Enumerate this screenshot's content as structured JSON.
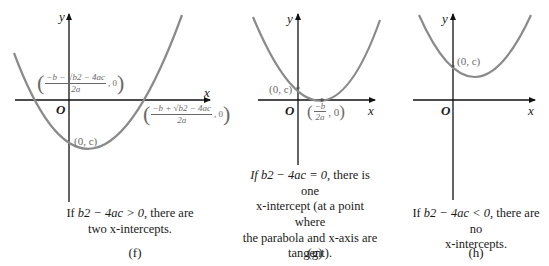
{
  "panels": [
    {
      "id": "f",
      "tag": "(f)",
      "axis_x_label": "x",
      "axis_y_label": "y",
      "origin_label": "O",
      "y_intercept_label": "(0, c)",
      "root_left_label": {
        "numerator": "−b − √b2 − 4ac",
        "denominator": "2a",
        "tail": ", 0"
      },
      "root_right_label": {
        "numerator": "−b + √b2 − 4ac",
        "denominator": "2a",
        "tail": ", 0"
      },
      "caption": {
        "prefix": "If ",
        "condition": "b2 − 4ac > 0",
        "suffix": ", there are",
        "line2": "two x-intercepts."
      }
    },
    {
      "id": "g",
      "tag": "(g)",
      "axis_x_label": "x",
      "axis_y_label": "y",
      "origin_label": "O",
      "y_intercept_label": "(0, c)",
      "vertex_label": {
        "numerator": "−b",
        "denominator": "2a",
        "tail": ", 0"
      },
      "caption": {
        "prefix": "If ",
        "condition": "b2 − 4ac = 0",
        "suffix": ", there is one",
        "line2": "x-intercept (at a point where",
        "line3": "the parabola and x-axis are",
        "line4": "tangent)."
      }
    },
    {
      "id": "h",
      "tag": "(h)",
      "axis_x_label": "x",
      "axis_y_label": "y",
      "origin_label": "O",
      "y_intercept_label": "(0, c)",
      "caption": {
        "prefix": "If ",
        "condition": "b2 − 4ac < 0",
        "suffix": ", there are no",
        "line2": "x-intercepts."
      }
    }
  ],
  "colors": {
    "axis": "#111111",
    "curve": "#8a8a8a",
    "label": "#6a6a6a",
    "text": "#1a1a1a"
  }
}
